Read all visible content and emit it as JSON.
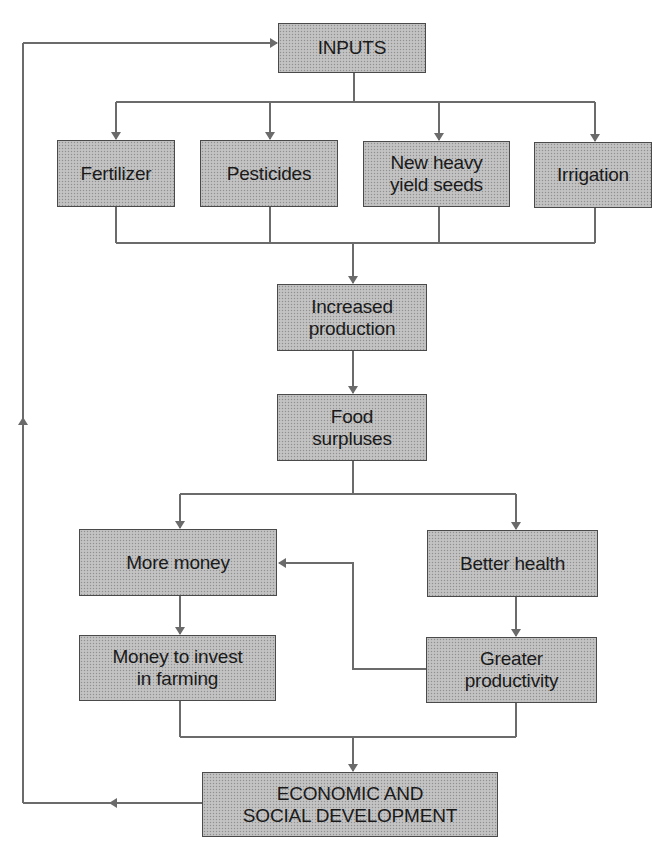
{
  "diagram": {
    "type": "flowchart",
    "colors": {
      "line": "#6b6b6b",
      "box_fill": "#bdbdbd",
      "box_border": "#4a4a4a",
      "text": "#1a1a1a"
    },
    "nodes": {
      "inputs": "INPUTS",
      "fertilizer": "Fertilizer",
      "pesticides": "Pesticides",
      "seeds": "New heavy\nyield seeds",
      "irrigation": "Irrigation",
      "increased_production": "Increased\nproduction",
      "food_surpluses": "Food\nsurpluses",
      "more_money": "More money",
      "better_health": "Better health",
      "money_to_invest": "Money to invest\nin farming",
      "greater_productivity": "Greater\nproductivity",
      "development": "ECONOMIC AND\nSOCIAL DEVELOPMENT"
    },
    "edges": [
      {
        "from": "inputs",
        "to": "fertilizer"
      },
      {
        "from": "inputs",
        "to": "pesticides"
      },
      {
        "from": "inputs",
        "to": "seeds"
      },
      {
        "from": "inputs",
        "to": "irrigation"
      },
      {
        "from": "fertilizer",
        "to": "increased_production"
      },
      {
        "from": "pesticides",
        "to": "increased_production"
      },
      {
        "from": "seeds",
        "to": "increased_production"
      },
      {
        "from": "irrigation",
        "to": "increased_production"
      },
      {
        "from": "increased_production",
        "to": "food_surpluses"
      },
      {
        "from": "food_surpluses",
        "to": "more_money"
      },
      {
        "from": "food_surpluses",
        "to": "better_health"
      },
      {
        "from": "more_money",
        "to": "money_to_invest"
      },
      {
        "from": "better_health",
        "to": "greater_productivity"
      },
      {
        "from": "greater_productivity",
        "to": "more_money"
      },
      {
        "from": "money_to_invest",
        "to": "development"
      },
      {
        "from": "greater_productivity",
        "to": "development"
      },
      {
        "from": "development",
        "to": "inputs"
      }
    ]
  }
}
